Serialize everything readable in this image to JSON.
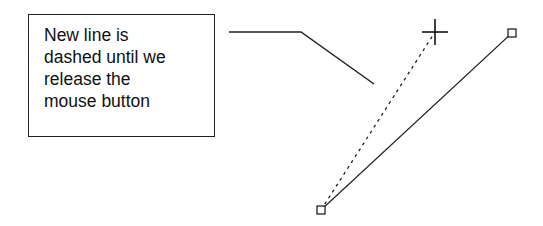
{
  "callout": {
    "lines": [
      "New line is",
      "dashed until we",
      "release the",
      "mouse button"
    ]
  },
  "drawing": {
    "connector_points": [
      [
        229,
        32
      ],
      [
        301,
        32
      ],
      [
        374,
        84
      ]
    ],
    "dashed_line": {
      "from": [
        321,
        210
      ],
      "to": [
        435,
        32
      ]
    },
    "solid_line": {
      "from": [
        321,
        210
      ],
      "to": [
        512,
        33
      ]
    },
    "cursor": {
      "type": "crosshair",
      "x": 435,
      "y": 32
    },
    "handles": [
      {
        "name": "start-handle",
        "x": 321,
        "y": 210
      },
      {
        "name": "end-handle",
        "x": 512,
        "y": 33
      }
    ],
    "stroke_color": "#222222"
  }
}
